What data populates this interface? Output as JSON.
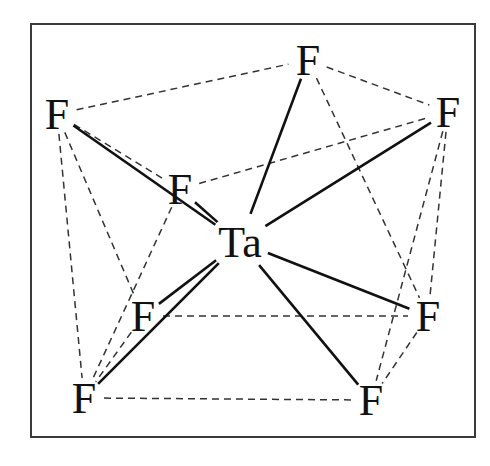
{
  "colors": {
    "ink": "#111111",
    "frame": "#3a3a3a",
    "background": "#ffffff"
  },
  "atoms": [
    {
      "id": "Ta",
      "label": "Ta",
      "element": "Ta"
    },
    {
      "id": "F1",
      "label": "F",
      "element": "F"
    },
    {
      "id": "F2",
      "label": "F",
      "element": "F"
    },
    {
      "id": "F3",
      "label": "F",
      "element": "F"
    },
    {
      "id": "F4",
      "label": "F",
      "element": "F"
    },
    {
      "id": "F5",
      "label": "F",
      "element": "F"
    },
    {
      "id": "F6",
      "label": "F",
      "element": "F"
    },
    {
      "id": "F7",
      "label": "F",
      "element": "F"
    },
    {
      "id": "F8",
      "label": "F",
      "element": "F"
    }
  ],
  "bonds": [
    {
      "from": "Ta",
      "to": "F1",
      "style": "solid"
    },
    {
      "from": "Ta",
      "to": "F2",
      "style": "solid"
    },
    {
      "from": "Ta",
      "to": "F3",
      "style": "solid"
    },
    {
      "from": "Ta",
      "to": "F4",
      "style": "solid"
    },
    {
      "from": "Ta",
      "to": "F5",
      "style": "solid"
    },
    {
      "from": "Ta",
      "to": "F6",
      "style": "solid"
    },
    {
      "from": "Ta",
      "to": "F7",
      "style": "solid"
    },
    {
      "from": "Ta",
      "to": "F8",
      "style": "solid"
    }
  ],
  "polyhedron_edges": [
    {
      "from": "F3",
      "to": "F1",
      "style": "dashed"
    },
    {
      "from": "F1",
      "to": "F2",
      "style": "dashed"
    },
    {
      "from": "F4",
      "to": "F2",
      "style": "dashed"
    },
    {
      "from": "F3",
      "to": "F4",
      "style": "dashed"
    },
    {
      "from": "F3",
      "to": "F7",
      "style": "dashed"
    },
    {
      "from": "F3",
      "to": "F5",
      "style": "dashed"
    },
    {
      "from": "F4",
      "to": "F7",
      "style": "dashed"
    },
    {
      "from": "F5",
      "to": "F7",
      "style": "dashed"
    },
    {
      "from": "F1",
      "to": "F6",
      "style": "dashed"
    },
    {
      "from": "F2",
      "to": "F6",
      "style": "dashed"
    },
    {
      "from": "F2",
      "to": "F8",
      "style": "dashed"
    },
    {
      "from": "F5",
      "to": "F6",
      "style": "dashed"
    },
    {
      "from": "F7",
      "to": "F8",
      "style": "dashed"
    },
    {
      "from": "F6",
      "to": "F8",
      "style": "dashed"
    }
  ]
}
